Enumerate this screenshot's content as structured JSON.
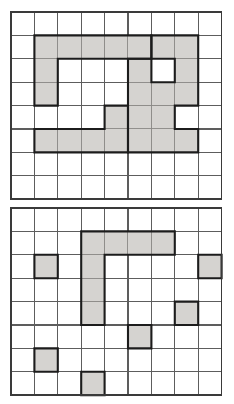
{
  "figure": {
    "title": "Two square-grid puzzle diagrams",
    "background_color": "#ffffff",
    "width": 234,
    "height": 404,
    "panel_count": 2
  },
  "style": {
    "shade_color": "#d5d3d0",
    "piece_outline_color": "#1c1c1c",
    "grid_line_color": "#5d5d5d",
    "grid_border_color": "#3a3a3a",
    "cell_size": 23.4
  },
  "panels": [
    {
      "id": "top-grid",
      "name": "upper-grid-panel",
      "label": "Upper grid",
      "origin_x": 11,
      "origin_y": 12,
      "columns": 9,
      "rows": 8,
      "cell_size": 23.4,
      "piece_count": 2,
      "shaded_cell_count": 24,
      "pieces": [
        {
          "id": "top-piece-left",
          "name": "left-zigzag-piece",
          "label": "Left interlocking piece",
          "cell_count": 12,
          "cells": [
            [
              1,
              1
            ],
            [
              2,
              1
            ],
            [
              3,
              1
            ],
            [
              4,
              1
            ],
            [
              5,
              1
            ],
            [
              1,
              2
            ],
            [
              1,
              3
            ],
            [
              1,
              5
            ],
            [
              2,
              5
            ],
            [
              3,
              5
            ],
            [
              4,
              5
            ],
            [
              4,
              4
            ]
          ]
        },
        {
          "id": "top-piece-right",
          "name": "right-zigzag-piece",
          "label": "Right interlocking piece",
          "cell_count": 12,
          "cells": [
            [
              6,
              1
            ],
            [
              7,
              1
            ],
            [
              7,
              2
            ],
            [
              7,
              3
            ],
            [
              5,
              2
            ],
            [
              5,
              3
            ],
            [
              5,
              4
            ],
            [
              5,
              5
            ],
            [
              6,
              5
            ],
            [
              7,
              5
            ],
            [
              6,
              3
            ],
            [
              6,
              4
            ]
          ]
        }
      ]
    },
    {
      "id": "bottom-grid",
      "name": "lower-grid-panel",
      "label": "Lower grid",
      "origin_x": 11,
      "origin_y": 208,
      "columns": 9,
      "rows": 8,
      "cell_size": 23.4,
      "piece_count": 7,
      "shaded_cell_count": 13,
      "pieces": [
        {
          "id": "bottom-piece-L",
          "name": "L-shaped-piece",
          "label": "L-shaped piece",
          "cell_count": 7,
          "cells": [
            [
              3,
              1
            ],
            [
              4,
              1
            ],
            [
              5,
              1
            ],
            [
              6,
              1
            ],
            [
              3,
              2
            ],
            [
              3,
              3
            ],
            [
              3,
              4
            ]
          ]
        },
        {
          "id": "bottom-single-1",
          "name": "single-cell-piece",
          "label": "Single cell",
          "cell_count": 1,
          "cells": [
            [
              1,
              2
            ]
          ]
        },
        {
          "id": "bottom-single-2",
          "name": "single-cell-piece",
          "label": "Single cell",
          "cell_count": 1,
          "cells": [
            [
              8,
              2
            ]
          ]
        },
        {
          "id": "bottom-single-3",
          "name": "single-cell-piece",
          "label": "Single cell",
          "cell_count": 1,
          "cells": [
            [
              7,
              4
            ]
          ]
        },
        {
          "id": "bottom-single-4",
          "name": "single-cell-piece",
          "label": "Single cell",
          "cell_count": 1,
          "cells": [
            [
              5,
              5
            ]
          ]
        },
        {
          "id": "bottom-single-5",
          "name": "single-cell-piece",
          "label": "Single cell",
          "cell_count": 1,
          "cells": [
            [
              1,
              6
            ]
          ]
        },
        {
          "id": "bottom-single-6",
          "name": "single-cell-piece",
          "label": "Single cell",
          "cell_count": 1,
          "cells": [
            [
              3,
              7
            ]
          ]
        }
      ]
    }
  ]
}
